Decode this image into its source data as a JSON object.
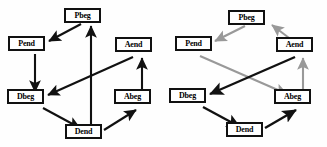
{
  "figure": {
    "panels": [
      {
        "id": "left-panel",
        "name": "left-graph",
        "edge_color_default": "#111111",
        "nodes": [
          {
            "id": "Pbeg",
            "label": "Pbeg",
            "x": 84,
            "y": 14
          },
          {
            "id": "Pend",
            "label": "Pend",
            "x": 26,
            "y": 44
          },
          {
            "id": "Aend",
            "label": "Aend",
            "x": 133,
            "y": 45
          },
          {
            "id": "Dbeg",
            "label": "Dbeg",
            "x": 24,
            "y": 97
          },
          {
            "id": "Abeg",
            "label": "Abeg",
            "x": 131,
            "y": 97
          },
          {
            "id": "Dend",
            "label": "Dend",
            "x": 82,
            "y": 131
          }
        ],
        "edges": [
          {
            "from": "Pbeg",
            "to": "Pend",
            "color": "#111111"
          },
          {
            "from": "Pend",
            "to": "Dbeg",
            "color": "#111111"
          },
          {
            "from": "Dend",
            "to": "Pbeg",
            "color": "#111111"
          },
          {
            "from": "Aend",
            "to": "Dbeg",
            "color": "#111111"
          },
          {
            "from": "Abeg",
            "to": "Aend",
            "color": "#111111"
          },
          {
            "from": "Dbeg",
            "to": "Dend",
            "color": "#111111"
          },
          {
            "from": "Dend",
            "to": "Abeg",
            "color": "#111111"
          }
        ]
      },
      {
        "id": "right-panel",
        "name": "right-graph",
        "edge_color_default": "#999999",
        "edge_color_highlight": "#111111",
        "nodes": [
          {
            "id": "Pbeg",
            "label": "Pbeg",
            "x": 247,
            "y": 16
          },
          {
            "id": "Pend",
            "label": "Pend",
            "x": 192,
            "y": 44
          },
          {
            "id": "Aend",
            "label": "Aend",
            "x": 293,
            "y": 45
          },
          {
            "id": "Dbeg",
            "label": "Dbeg",
            "x": 186,
            "y": 96
          },
          {
            "id": "Abeg",
            "label": "Abeg",
            "x": 291,
            "y": 97
          },
          {
            "id": "Dend",
            "label": "Dend",
            "x": 243,
            "y": 129
          }
        ],
        "edges": [
          {
            "from": "Pbeg",
            "to": "Pend",
            "color": "#999999"
          },
          {
            "from": "Aend",
            "to": "Pbeg",
            "color": "#999999"
          },
          {
            "from": "Pend",
            "to": "Abeg",
            "color": "#999999"
          },
          {
            "from": "Abeg",
            "to": "Aend",
            "color": "#999999"
          },
          {
            "from": "Aend",
            "to": "Dbeg",
            "color": "#111111"
          },
          {
            "from": "Dbeg",
            "to": "Dend",
            "color": "#111111"
          },
          {
            "from": "Dend",
            "to": "Abeg",
            "color": "#111111"
          }
        ]
      }
    ]
  }
}
